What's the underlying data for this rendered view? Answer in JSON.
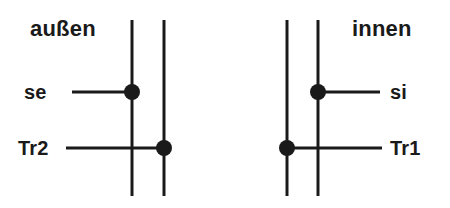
{
  "diagram": {
    "title_text_outside": "außen",
    "title_text_inside": "innen",
    "labels": {
      "outside": "außen",
      "inside": "innen",
      "se": "se",
      "si": "si",
      "tr2": "Tr2",
      "tr1": "Tr1"
    },
    "colors": {
      "stroke": "#1a1a1a",
      "background": "#ffffff",
      "node": "#1a1a1a"
    },
    "geometry": {
      "stroke_width": 3,
      "node_radius": 8,
      "vertical_lines": [
        {
          "name": "left-outer-vertical",
          "x": 132,
          "y1": 20,
          "y2": 196
        },
        {
          "name": "left-inner-vertical",
          "x": 164,
          "y1": 20,
          "y2": 196
        },
        {
          "name": "right-inner-vertical",
          "x": 287,
          "y1": 20,
          "y2": 196
        },
        {
          "name": "right-outer-vertical",
          "x": 318,
          "y1": 20,
          "y2": 196
        }
      ],
      "horizontal_lines": [
        {
          "name": "se-branch",
          "y": 92,
          "x1": 72,
          "x2": 132
        },
        {
          "name": "tr2-branch",
          "y": 148,
          "x1": 66,
          "x2": 164
        },
        {
          "name": "si-branch",
          "y": 92,
          "x1": 318,
          "x2": 380
        },
        {
          "name": "tr1-branch",
          "y": 148,
          "x1": 287,
          "x2": 382
        }
      ],
      "nodes": [
        {
          "name": "se-node",
          "x": 132,
          "y": 92
        },
        {
          "name": "tr2-node",
          "x": 164,
          "y": 148
        },
        {
          "name": "si-node",
          "x": 318,
          "y": 92
        },
        {
          "name": "tr1-node",
          "x": 287,
          "y": 148
        }
      ]
    }
  }
}
